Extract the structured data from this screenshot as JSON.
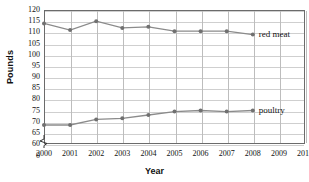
{
  "chart_data": {
    "type": "line",
    "title": "",
    "xlabel": "Year",
    "ylabel": "Pounds",
    "x": [
      2000,
      2001,
      2002,
      2003,
      2004,
      2005,
      2006,
      2007,
      2008
    ],
    "xlim": [
      2000,
      2010
    ],
    "ylim": [
      60,
      120
    ],
    "y_axis_break": true,
    "y_break_from": 0,
    "y_break_to": 60,
    "xticks": [
      "2000",
      "2001",
      "2002",
      "2003",
      "2004",
      "2005",
      "2006",
      "2007",
      "2008",
      "2009",
      "2010"
    ],
    "yticks": [
      "0",
      "60",
      "65",
      "70",
      "75",
      "80",
      "85",
      "90",
      "95",
      "100",
      "105",
      "110",
      "115",
      "120"
    ],
    "grid": true,
    "legend_position": "inline-right",
    "series": [
      {
        "name": "red meat",
        "color": "#8b8b8b",
        "values": [
          114,
          111,
          115,
          112,
          112.5,
          110.5,
          110.5,
          110.5,
          109
        ]
      },
      {
        "name": "poultry",
        "color": "#8b8b8b",
        "values": [
          68.5,
          68.5,
          71,
          71.5,
          73,
          74.5,
          75,
          74.5,
          75
        ]
      }
    ]
  },
  "labels": {
    "red_meat": "red meat",
    "poultry": "poultry",
    "x_axis_title": "Year",
    "y_axis_title": "Pounds"
  }
}
